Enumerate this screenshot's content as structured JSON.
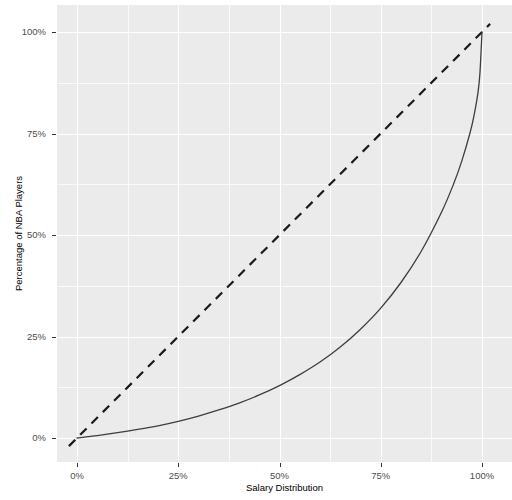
{
  "chart_data": {
    "type": "line",
    "title": "",
    "subtitle": "",
    "xlabel": "Salary Distribution",
    "ylabel": "Percentage of NBA Players",
    "xlim": [
      0,
      100
    ],
    "ylim": [
      0,
      100
    ],
    "grid": true,
    "legend": "none",
    "x_ticks": [
      {
        "value": 0,
        "label": "0%"
      },
      {
        "value": 25,
        "label": "25%"
      },
      {
        "value": 50,
        "label": "50%"
      },
      {
        "value": 75,
        "label": "75%"
      },
      {
        "value": 100,
        "label": "100%"
      }
    ],
    "y_ticks": [
      {
        "value": 0,
        "label": "0%"
      },
      {
        "value": 25,
        "label": "25%"
      },
      {
        "value": 50,
        "label": "50%"
      },
      {
        "value": 75,
        "label": "75%"
      },
      {
        "value": 100,
        "label": "100%"
      }
    ],
    "x_minor_ticks": [
      12.5,
      37.5,
      62.5,
      87.5
    ],
    "y_minor_ticks": [
      12.5,
      37.5,
      62.5,
      87.5
    ],
    "series": [
      {
        "name": "Lorenz curve",
        "style": "solid",
        "color": "#3d3d3d",
        "width": 1.3,
        "x": [
          0,
          5,
          10,
          15,
          20,
          25,
          30,
          35,
          40,
          45,
          50,
          55,
          60,
          65,
          70,
          75,
          80,
          85,
          90,
          93,
          95,
          97,
          98,
          99,
          99.5,
          100
        ],
        "y": [
          0,
          0.6,
          1.3,
          2.1,
          3.0,
          4.1,
          5.4,
          6.9,
          8.6,
          10.6,
          12.9,
          15.6,
          18.7,
          22.4,
          26.8,
          32.0,
          38.3,
          46.0,
          55.6,
          62.6,
          68.2,
          75.0,
          79.3,
          85.0,
          90.0,
          100.0
        ]
      },
      {
        "name": "Line of equality",
        "style": "dashed",
        "color": "#1a1a1a",
        "width": 2.2,
        "x": [
          -2,
          102
        ],
        "y": [
          -2,
          102
        ]
      }
    ],
    "colors": {
      "panel_background": "#ebebeb",
      "gridline": "#ffffff",
      "curve": "#3d3d3d",
      "equality_line": "#1a1a1a",
      "tick_label": "#4d4d4d",
      "axis_title": "#000000",
      "figure_background": "#ffffff"
    }
  }
}
